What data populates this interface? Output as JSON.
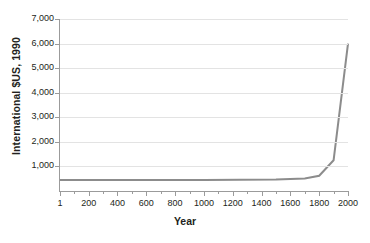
{
  "chart_data": {
    "type": "line",
    "title": "",
    "subtitle": "",
    "xlabel": "Year",
    "ylabel": "International $US, 1990",
    "xlim": [
      1,
      2000
    ],
    "ylim": [
      0,
      7000
    ],
    "grid": true,
    "legend": null,
    "x_ticks": [
      {
        "value": 1,
        "label": "1"
      },
      {
        "value": 200,
        "label": "200"
      },
      {
        "value": 400,
        "label": "400"
      },
      {
        "value": 600,
        "label": "600"
      },
      {
        "value": 800,
        "label": "800"
      },
      {
        "value": 1000,
        "label": "1000"
      },
      {
        "value": 1200,
        "label": "1200"
      },
      {
        "value": 1400,
        "label": "1400"
      },
      {
        "value": 1600,
        "label": "1600"
      },
      {
        "value": 1800,
        "label": "1800"
      },
      {
        "value": 2000,
        "label": "2000"
      }
    ],
    "x_minor_ticks": [
      100,
      300,
      500,
      700,
      900,
      1100,
      1300,
      1500,
      1700,
      1900
    ],
    "y_ticks": [
      {
        "value": 1000,
        "label": "1,000"
      },
      {
        "value": 2000,
        "label": "2,000"
      },
      {
        "value": 3000,
        "label": "3,000"
      },
      {
        "value": 4000,
        "label": "4,000"
      },
      {
        "value": 5000,
        "label": "5,000"
      },
      {
        "value": 6000,
        "label": "6,000"
      },
      {
        "value": 7000,
        "label": "7,000"
      }
    ],
    "series": [
      {
        "name": "World GDP per capita",
        "color": "#8c8c8c",
        "x": [
          1,
          1000,
          1500,
          1700,
          1800,
          1900,
          2000
        ],
        "values": [
          450,
          450,
          470,
          510,
          620,
          1250,
          6000
        ]
      }
    ]
  },
  "colors": {
    "line": "#8c8c8c",
    "grid": "#e3e3e3",
    "axis": "#9b9b9b",
    "text": "#231f20",
    "background": "#ffffff"
  },
  "caption_ghost": ""
}
